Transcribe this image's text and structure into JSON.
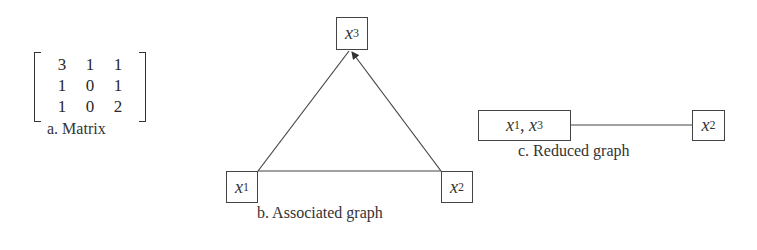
{
  "panel_a": {
    "matrix": [
      [
        "3",
        "1",
        "1"
      ],
      [
        "1",
        "0",
        "1"
      ],
      [
        "1",
        "0",
        "2"
      ]
    ],
    "caption": "a. Matrix"
  },
  "panel_b": {
    "nodes": {
      "x1": {
        "var": "x",
        "sub": "1"
      },
      "x2": {
        "var": "x",
        "sub": "2"
      },
      "x3": {
        "var": "x",
        "sub": "3"
      }
    },
    "edges": [
      {
        "from": "x1",
        "to": "x3",
        "arrow": false
      },
      {
        "from": "x2",
        "to": "x3",
        "arrow": true
      },
      {
        "from": "x1",
        "to": "x2",
        "arrow": false
      }
    ],
    "caption": "b. Associated graph"
  },
  "panel_c": {
    "nodes": {
      "x1x3": {
        "var1": "x",
        "sub1": "1",
        "sep": ", ",
        "var2": "x",
        "sub2": "3"
      },
      "x2": {
        "var": "x",
        "sub": "2"
      }
    },
    "edges": [
      {
        "from": "x1x3",
        "to": "x2",
        "arrow": false
      }
    ],
    "caption": "c. Reduced graph"
  }
}
